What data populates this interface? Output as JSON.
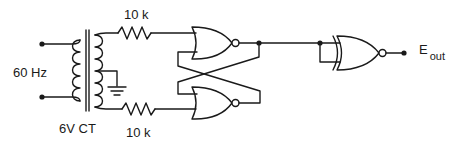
{
  "diagram": {
    "type": "circuit-schematic",
    "labels": {
      "source_frequency": "60 Hz",
      "transformer_rating": "6V CT",
      "resistor_top": "10 k",
      "resistor_bottom": "10 k",
      "output_main": "E",
      "output_sub": "out"
    },
    "components": [
      {
        "id": "T1",
        "kind": "center-tapped transformer",
        "label": "6V CT"
      },
      {
        "id": "R1",
        "kind": "resistor",
        "value": "10 k"
      },
      {
        "id": "R2",
        "kind": "resistor",
        "value": "10 k"
      },
      {
        "id": "U1",
        "kind": "NOR gate"
      },
      {
        "id": "U2",
        "kind": "NOR gate"
      },
      {
        "id": "U3",
        "kind": "XNOR gate"
      },
      {
        "id": "GND",
        "kind": "ground"
      }
    ],
    "colors": {
      "stroke": "#1a1a1a",
      "background": "#ffffff"
    }
  }
}
